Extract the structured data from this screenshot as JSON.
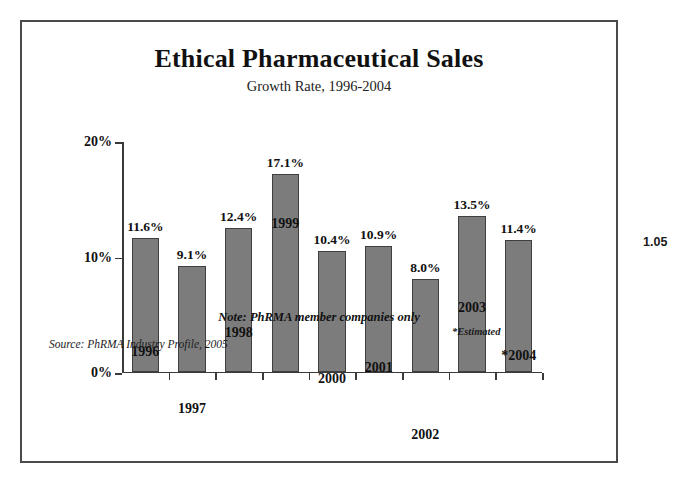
{
  "page_marker": "1.05",
  "chart_data": {
    "type": "bar",
    "title": "Ethical Pharmaceutical Sales",
    "subtitle": "Growth Rate, 1996-2004",
    "xlabel": "",
    "ylabel": "",
    "ylim": [
      0,
      20
    ],
    "grid": false,
    "legend": "none",
    "bar_color": "#7c7c7c",
    "bar_border_color": "#3f3f3f",
    "axis_color": "#3a3a3a",
    "ytick_labels": [
      "20%",
      "10%",
      "0%"
    ],
    "ytick_values": [
      20,
      10,
      0
    ],
    "categories": [
      "1996",
      "1997",
      "1998",
      "1999",
      "2000",
      "2001",
      "2002",
      "2003",
      "*2004"
    ],
    "values": [
      11.6,
      9.1,
      12.4,
      17.1,
      10.4,
      10.9,
      8.0,
      13.5,
      11.4
    ],
    "value_labels": [
      "11.6%",
      "9.1%",
      "12.4%",
      "17.1%",
      "10.4%",
      "10.9%",
      "8.0%",
      "13.5%",
      "11.4%"
    ],
    "notes": {
      "note": "Note: PhRMA member companies only",
      "estimated": "*Estimated",
      "source": "Source: PhRMA Industry Profile, 2005"
    }
  }
}
